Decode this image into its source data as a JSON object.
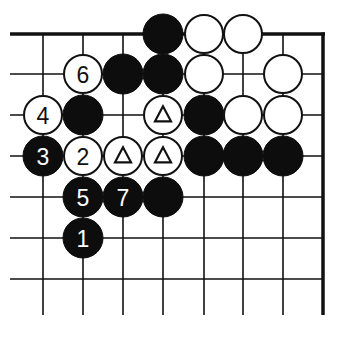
{
  "diagram": {
    "type": "go-board-fragment",
    "colors": {
      "background": "#ffffff",
      "line": "#111111",
      "black": "#0d0d0d",
      "white": "#ffffff"
    },
    "grid": {
      "columns_x": [
        43,
        83,
        123,
        163,
        204,
        243,
        283
      ],
      "rows_y": [
        34,
        74,
        115,
        156,
        197,
        238,
        279
      ],
      "left_fade_x": 10,
      "right_edge_x": 323,
      "top_edge_y": 34,
      "bottom_fade_y": 315,
      "edges": [
        "top",
        "right"
      ]
    },
    "stone_radius": 20,
    "stones": [
      {
        "col": 3,
        "row": 0,
        "color": "black",
        "label": ""
      },
      {
        "col": 4,
        "row": 0,
        "color": "white",
        "label": ""
      },
      {
        "col": 5,
        "row": 0,
        "color": "white",
        "label": ""
      },
      {
        "col": 1,
        "row": 1,
        "color": "white",
        "label": "6"
      },
      {
        "col": 2,
        "row": 1,
        "color": "black",
        "label": ""
      },
      {
        "col": 3,
        "row": 1,
        "color": "black",
        "label": ""
      },
      {
        "col": 4,
        "row": 1,
        "color": "white",
        "label": ""
      },
      {
        "col": 6,
        "row": 1,
        "color": "white",
        "label": ""
      },
      {
        "col": 0,
        "row": 2,
        "color": "white",
        "label": "4"
      },
      {
        "col": 1,
        "row": 2,
        "color": "black",
        "label": ""
      },
      {
        "col": 3,
        "row": 2,
        "color": "white",
        "label": "",
        "marker": "triangle"
      },
      {
        "col": 4,
        "row": 2,
        "color": "black",
        "label": ""
      },
      {
        "col": 5,
        "row": 2,
        "color": "white",
        "label": ""
      },
      {
        "col": 6,
        "row": 2,
        "color": "white",
        "label": ""
      },
      {
        "col": 0,
        "row": 3,
        "color": "black",
        "label": "3"
      },
      {
        "col": 1,
        "row": 3,
        "color": "white",
        "label": "2"
      },
      {
        "col": 2,
        "row": 3,
        "color": "white",
        "label": "",
        "marker": "triangle"
      },
      {
        "col": 3,
        "row": 3,
        "color": "white",
        "label": "",
        "marker": "triangle"
      },
      {
        "col": 4,
        "row": 3,
        "color": "black",
        "label": ""
      },
      {
        "col": 5,
        "row": 3,
        "color": "black",
        "label": ""
      },
      {
        "col": 6,
        "row": 3,
        "color": "black",
        "label": ""
      },
      {
        "col": 1,
        "row": 4,
        "color": "black",
        "label": "5"
      },
      {
        "col": 2,
        "row": 4,
        "color": "black",
        "label": "7"
      },
      {
        "col": 3,
        "row": 4,
        "color": "black",
        "label": ""
      },
      {
        "col": 1,
        "row": 5,
        "color": "black",
        "label": "1"
      }
    ]
  }
}
